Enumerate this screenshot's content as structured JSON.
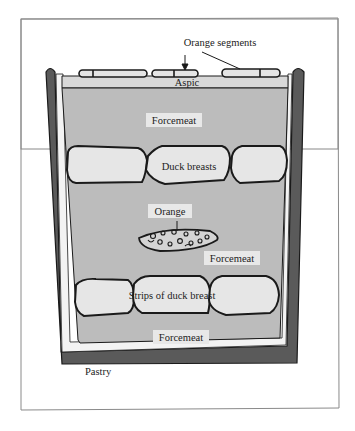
{
  "diagram": {
    "colors": {
      "pastry": "#5a5a5a",
      "pastry_inner": "#f2f2f2",
      "forcemeat": "#bdbdbd",
      "aspic": "#d6d6d6",
      "duck": "#e6e6e6",
      "outline": "#1a1a1a",
      "frame": "#888888",
      "label_bg": "#e4e4e4"
    },
    "labels": {
      "orange_segments": "Orange segments",
      "aspic": "Aspic",
      "forcemeat_top": "Forcemeat",
      "duck_breasts": "Duck breasts",
      "orange": "Orange",
      "forcemeat_middle": "Forcemeat",
      "strips_of_duck_breast": "Strips of duck breast",
      "forcemeat_bottom": "Forcemeat",
      "pastry": "Pastry"
    }
  }
}
